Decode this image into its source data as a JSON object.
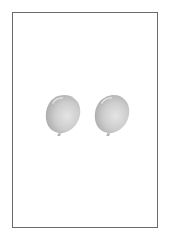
{
  "figure": {
    "frame_color": "#6a6a6a",
    "balloon_count": 2,
    "balloons": [
      {
        "label": "balloon-1",
        "color": "#c4c4c4",
        "highlight": "#e8e8e8",
        "shadow": "#a8a8a8"
      },
      {
        "label": "balloon-2",
        "color": "#c4c4c4",
        "highlight": "#e8e8e8",
        "shadow": "#a8a8a8"
      }
    ]
  }
}
